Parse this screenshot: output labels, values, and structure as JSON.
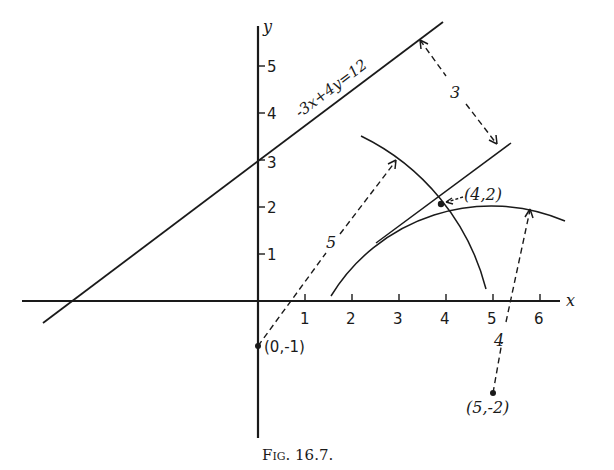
{
  "figure": {
    "caption": "Fig. 16.7.",
    "axes": {
      "x_label": "x",
      "y_label": "y",
      "x_ticks": [
        "1",
        "2",
        "3",
        "4",
        "5",
        "6"
      ],
      "y_ticks": [
        "1",
        "2",
        "3",
        "4",
        "5"
      ]
    },
    "line": {
      "equation": "-3x + 4y = 12",
      "label": "-3x+4y=12"
    },
    "distance_labels": {
      "between_lines": "3",
      "radius_from_0_-1": "5",
      "radius_from_5_-2": "4"
    },
    "points": [
      {
        "label": "(0,-1)",
        "x": 0,
        "y": -1
      },
      {
        "label": "(5,-2)",
        "x": 5,
        "y": -2
      },
      {
        "label": "(4,2)",
        "x": 4,
        "y": 2
      }
    ],
    "point_labels": {
      "p0": "(0,-1)",
      "p1": "(5,-2)",
      "p2": "(4,2)"
    },
    "colors": {
      "ink": "#1a1a1a",
      "background": "#ffffff"
    }
  }
}
